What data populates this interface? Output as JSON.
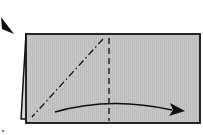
{
  "diagram": {
    "type": "origami-fold-step",
    "paper_fill": "#c4c4c4",
    "outline_color": "#111111",
    "elements": [
      {
        "name": "folded-rectangle",
        "kind": "paper"
      },
      {
        "name": "valley-fold-line",
        "kind": "dashed vertical line"
      },
      {
        "name": "mountain-fold-line",
        "kind": "dash-dot diagonal line"
      },
      {
        "name": "fold-direction-arrow",
        "kind": "curved arrow pointing right"
      },
      {
        "name": "corner-pointer-arrow",
        "kind": "arrowhead at top-left"
      }
    ]
  }
}
